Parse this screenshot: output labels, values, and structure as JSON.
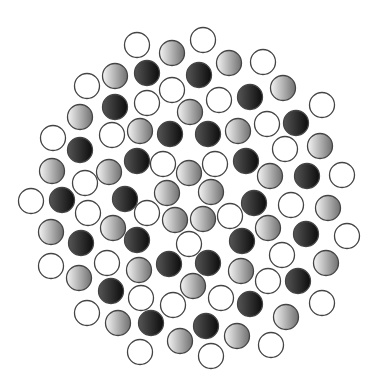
{
  "figure": {
    "width": 381,
    "height": 389,
    "background": "#ffffff",
    "radius": 12.5,
    "stroke": "#444444",
    "styles": {
      "white": {
        "fill": "#ffffff"
      },
      "gray": {
        "from": "#f4f4f4",
        "to": "#707070"
      },
      "black": {
        "from": "#555555",
        "to": "#0c0c0c"
      }
    },
    "circles": [
      {
        "x": 137,
        "y": 45,
        "t": "white"
      },
      {
        "x": 172,
        "y": 53,
        "t": "gray"
      },
      {
        "x": 203,
        "y": 40,
        "t": "white"
      },
      {
        "x": 229,
        "y": 63,
        "t": "gray"
      },
      {
        "x": 263,
        "y": 62,
        "t": "white"
      },
      {
        "x": 87,
        "y": 86,
        "t": "white"
      },
      {
        "x": 115,
        "y": 76,
        "t": "gray"
      },
      {
        "x": 147,
        "y": 73,
        "t": "black"
      },
      {
        "x": 199,
        "y": 75,
        "t": "black"
      },
      {
        "x": 172,
        "y": 90,
        "t": "white"
      },
      {
        "x": 219,
        "y": 100,
        "t": "white"
      },
      {
        "x": 250,
        "y": 97,
        "t": "black"
      },
      {
        "x": 283,
        "y": 88,
        "t": "gray"
      },
      {
        "x": 322,
        "y": 105,
        "t": "white"
      },
      {
        "x": 115,
        "y": 107,
        "t": "black"
      },
      {
        "x": 147,
        "y": 103,
        "t": "white"
      },
      {
        "x": 190,
        "y": 112,
        "t": "gray"
      },
      {
        "x": 80,
        "y": 117,
        "t": "gray"
      },
      {
        "x": 53,
        "y": 138,
        "t": "white"
      },
      {
        "x": 112,
        "y": 135,
        "t": "white"
      },
      {
        "x": 140,
        "y": 131,
        "t": "gray"
      },
      {
        "x": 170,
        "y": 134,
        "t": "black"
      },
      {
        "x": 208,
        "y": 134,
        "t": "black"
      },
      {
        "x": 238,
        "y": 131,
        "t": "gray"
      },
      {
        "x": 267,
        "y": 124,
        "t": "white"
      },
      {
        "x": 296,
        "y": 123,
        "t": "black"
      },
      {
        "x": 80,
        "y": 150,
        "t": "black"
      },
      {
        "x": 137,
        "y": 161,
        "t": "black"
      },
      {
        "x": 163,
        "y": 164,
        "t": "white"
      },
      {
        "x": 215,
        "y": 164,
        "t": "white"
      },
      {
        "x": 246,
        "y": 161,
        "t": "black"
      },
      {
        "x": 285,
        "y": 149,
        "t": "white"
      },
      {
        "x": 320,
        "y": 146,
        "t": "gray"
      },
      {
        "x": 52,
        "y": 171,
        "t": "gray"
      },
      {
        "x": 109,
        "y": 172,
        "t": "gray"
      },
      {
        "x": 189,
        "y": 173,
        "t": "gray"
      },
      {
        "x": 270,
        "y": 176,
        "t": "gray"
      },
      {
        "x": 307,
        "y": 176,
        "t": "black"
      },
      {
        "x": 342,
        "y": 175,
        "t": "white"
      },
      {
        "x": 85,
        "y": 183,
        "t": "white"
      },
      {
        "x": 31,
        "y": 201,
        "t": "white"
      },
      {
        "x": 62,
        "y": 200,
        "t": "black"
      },
      {
        "x": 125,
        "y": 199,
        "t": "black"
      },
      {
        "x": 167,
        "y": 193,
        "t": "gray"
      },
      {
        "x": 211,
        "y": 192,
        "t": "gray"
      },
      {
        "x": 254,
        "y": 203,
        "t": "black"
      },
      {
        "x": 291,
        "y": 205,
        "t": "white"
      },
      {
        "x": 328,
        "y": 208,
        "t": "gray"
      },
      {
        "x": 88,
        "y": 213,
        "t": "white"
      },
      {
        "x": 147,
        "y": 213,
        "t": "white"
      },
      {
        "x": 175,
        "y": 220,
        "t": "gray"
      },
      {
        "x": 203,
        "y": 219,
        "t": "gray"
      },
      {
        "x": 230,
        "y": 216,
        "t": "white"
      },
      {
        "x": 51,
        "y": 232,
        "t": "gray"
      },
      {
        "x": 113,
        "y": 228,
        "t": "gray"
      },
      {
        "x": 268,
        "y": 228,
        "t": "gray"
      },
      {
        "x": 306,
        "y": 234,
        "t": "black"
      },
      {
        "x": 347,
        "y": 236,
        "t": "white"
      },
      {
        "x": 81,
        "y": 243,
        "t": "black"
      },
      {
        "x": 137,
        "y": 240,
        "t": "black"
      },
      {
        "x": 189,
        "y": 244,
        "t": "white"
      },
      {
        "x": 242,
        "y": 241,
        "t": "black"
      },
      {
        "x": 282,
        "y": 255,
        "t": "white"
      },
      {
        "x": 326,
        "y": 263,
        "t": "gray"
      },
      {
        "x": 51,
        "y": 266,
        "t": "white"
      },
      {
        "x": 107,
        "y": 263,
        "t": "white"
      },
      {
        "x": 139,
        "y": 270,
        "t": "gray"
      },
      {
        "x": 169,
        "y": 264,
        "t": "black"
      },
      {
        "x": 208,
        "y": 263,
        "t": "black"
      },
      {
        "x": 241,
        "y": 271,
        "t": "gray"
      },
      {
        "x": 79,
        "y": 278,
        "t": "gray"
      },
      {
        "x": 193,
        "y": 286,
        "t": "gray"
      },
      {
        "x": 268,
        "y": 281,
        "t": "white"
      },
      {
        "x": 298,
        "y": 281,
        "t": "black"
      },
      {
        "x": 111,
        "y": 291,
        "t": "black"
      },
      {
        "x": 141,
        "y": 298,
        "t": "white"
      },
      {
        "x": 221,
        "y": 298,
        "t": "white"
      },
      {
        "x": 250,
        "y": 304,
        "t": "black"
      },
      {
        "x": 322,
        "y": 303,
        "t": "white"
      },
      {
        "x": 173,
        "y": 305,
        "t": "white"
      },
      {
        "x": 87,
        "y": 313,
        "t": "white"
      },
      {
        "x": 286,
        "y": 317,
        "t": "gray"
      },
      {
        "x": 118,
        "y": 323,
        "t": "gray"
      },
      {
        "x": 151,
        "y": 323,
        "t": "black"
      },
      {
        "x": 206,
        "y": 326,
        "t": "black"
      },
      {
        "x": 237,
        "y": 336,
        "t": "gray"
      },
      {
        "x": 180,
        "y": 341,
        "t": "gray"
      },
      {
        "x": 271,
        "y": 345,
        "t": "white"
      },
      {
        "x": 140,
        "y": 352,
        "t": "white"
      },
      {
        "x": 211,
        "y": 356,
        "t": "white"
      }
    ]
  }
}
